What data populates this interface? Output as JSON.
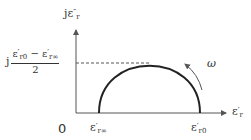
{
  "diagram": {
    "type": "cole-cole-semicircle",
    "y_axis": {
      "label_prefix": "j",
      "symbol": "ε",
      "prime": "″",
      "sub": "r"
    },
    "x_axis": {
      "symbol": "ε",
      "prime": "′",
      "sub": "r"
    },
    "origin_label": "0",
    "x_ticks": [
      {
        "symbol": "ε",
        "prime": "′",
        "sub": "r∞"
      },
      {
        "symbol": "ε",
        "prime": "′",
        "sub": "r0"
      }
    ],
    "peak_label": {
      "prefix": "j",
      "numerator_a": {
        "symbol": "ε",
        "prime": "′",
        "sub": "r0"
      },
      "operator": "−",
      "numerator_b": {
        "symbol": "ε",
        "prime": "′",
        "sub": "r∞"
      },
      "denominator": "2"
    },
    "direction_label": "ω",
    "colors": {
      "line": "#333333",
      "dashed": "#555555",
      "background": "#ffffff"
    }
  }
}
